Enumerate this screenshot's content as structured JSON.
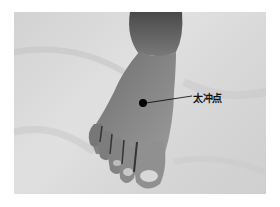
{
  "figure": {
    "annotation": {
      "label": "太冲点",
      "marker_color": "#000000"
    }
  }
}
